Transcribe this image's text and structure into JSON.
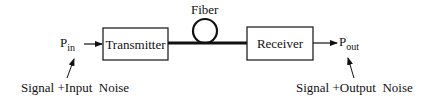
{
  "diagram": {
    "type": "block-diagram",
    "input": {
      "symbol": "P",
      "subscript": "in"
    },
    "output": {
      "symbol": "P",
      "subscript": "out"
    },
    "blocks": [
      {
        "id": "transmitter",
        "label": "Transmitter"
      },
      {
        "id": "receiver",
        "label": "Receiver"
      }
    ],
    "channel": {
      "label": "Fiber"
    },
    "annotations": {
      "input_note": "Signal +Input  Noise",
      "output_note": "Signal +Output  Noise"
    }
  }
}
